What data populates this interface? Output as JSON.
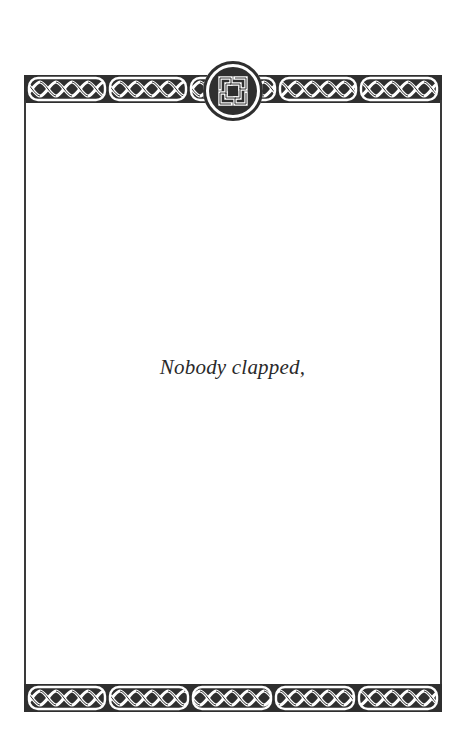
{
  "page": {
    "text": "Nobody clapped,",
    "background": "#ffffff",
    "ink_color": "#2f2f2f"
  },
  "border": {
    "style": "celtic-knotwork",
    "top_band": {
      "segments": 5,
      "has_center_medallion": true
    },
    "bottom_band": {
      "segments": 5,
      "has_center_medallion": false
    },
    "medallion": {
      "icon": "celtic-shield-knot-icon"
    }
  }
}
